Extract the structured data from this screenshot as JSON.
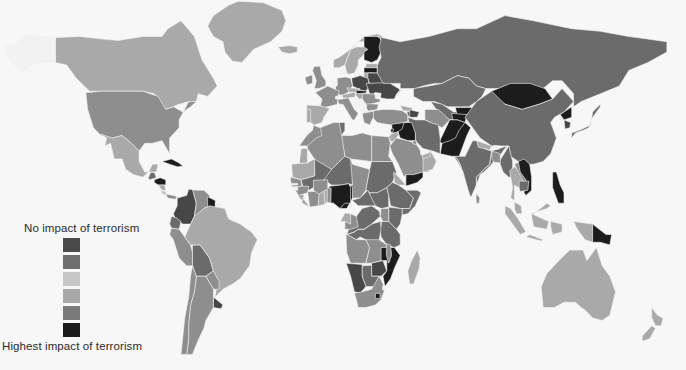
{
  "figure": {
    "type": "choropleth-world-map",
    "background_color": "#f7f7f7",
    "border_color": "#f4f4f4",
    "no_data_color": "#f2f2f2"
  },
  "legend": {
    "top_label": "No impact of terrorism",
    "bottom_label": "Highest impact of terrorism",
    "orientation": "vertical",
    "swatches": [
      {
        "name": "swatch-1",
        "color": "#4a4a4a"
      },
      {
        "name": "swatch-2",
        "color": "#6e6e6e"
      },
      {
        "name": "swatch-3",
        "color": "#c6c6c6"
      },
      {
        "name": "swatch-4",
        "color": "#a8a8a8"
      },
      {
        "name": "swatch-5",
        "color": "#7a7a7a"
      },
      {
        "name": "swatch-6",
        "color": "#1a1a1a"
      }
    ]
  },
  "footer": {
    "note": ""
  },
  "scale": {
    "none": "#d5d5d5",
    "very_low": "#c2c2c2",
    "low": "#a9a9a9",
    "medium": "#8e8e8e",
    "high": "#6b6b6b",
    "very_high": "#474747",
    "highest": "#1c1c1c",
    "nodata": "#f2f2f2"
  },
  "chart_data": {
    "type": "heatmap",
    "title": "",
    "subtitle": "",
    "xlabel": "",
    "ylabel": "",
    "legend_position": "bottom-left",
    "grid": false,
    "value_scale_low_label": "No impact of terrorism",
    "value_scale_high_label": "Highest impact of terrorism",
    "categories": [
      "No impact of terrorism",
      "Very low impact",
      "Low impact",
      "Medium impact",
      "High impact",
      "Very high impact",
      "Highest impact of terrorism"
    ],
    "regions": [
      {
        "name": "Canada",
        "level": "low"
      },
      {
        "name": "United States",
        "level": "medium"
      },
      {
        "name": "Mexico",
        "level": "low"
      },
      {
        "name": "Greenland",
        "level": "low"
      },
      {
        "name": "Cuba",
        "level": "highest"
      },
      {
        "name": "Guatemala",
        "level": "high"
      },
      {
        "name": "Honduras",
        "level": "highest"
      },
      {
        "name": "Nicaragua",
        "level": "low"
      },
      {
        "name": "Costa Rica",
        "level": "very_low"
      },
      {
        "name": "Panama",
        "level": "medium"
      },
      {
        "name": "Colombia",
        "level": "very_high"
      },
      {
        "name": "Venezuela",
        "level": "medium"
      },
      {
        "name": "Guyana",
        "level": "highest"
      },
      {
        "name": "Brazil",
        "level": "low"
      },
      {
        "name": "Peru",
        "level": "medium"
      },
      {
        "name": "Bolivia",
        "level": "high"
      },
      {
        "name": "Chile",
        "level": "medium"
      },
      {
        "name": "Argentina",
        "level": "medium"
      },
      {
        "name": "Uruguay",
        "level": "very_high"
      },
      {
        "name": "Paraguay",
        "level": "medium"
      },
      {
        "name": "Ecuador",
        "level": "high"
      },
      {
        "name": "United Kingdom",
        "level": "medium"
      },
      {
        "name": "Ireland",
        "level": "medium"
      },
      {
        "name": "Iceland",
        "level": "low"
      },
      {
        "name": "Norway",
        "level": "low"
      },
      {
        "name": "Sweden",
        "level": "low"
      },
      {
        "name": "Finland",
        "level": "highest"
      },
      {
        "name": "Estonia",
        "level": "low"
      },
      {
        "name": "Latvia",
        "level": "highest"
      },
      {
        "name": "Lithuania",
        "level": "low"
      },
      {
        "name": "Belarus",
        "level": "very_high"
      },
      {
        "name": "Poland",
        "level": "very_high"
      },
      {
        "name": "Germany",
        "level": "medium"
      },
      {
        "name": "France",
        "level": "medium"
      },
      {
        "name": "Spain",
        "level": "low"
      },
      {
        "name": "Portugal",
        "level": "low"
      },
      {
        "name": "Italy",
        "level": "medium"
      },
      {
        "name": "Austria",
        "level": "low"
      },
      {
        "name": "Czechia",
        "level": "low"
      },
      {
        "name": "Slovakia",
        "level": "highest"
      },
      {
        "name": "Hungary",
        "level": "low"
      },
      {
        "name": "Romania",
        "level": "medium"
      },
      {
        "name": "Bulgaria",
        "level": "medium"
      },
      {
        "name": "Greece",
        "level": "medium"
      },
      {
        "name": "Ukraine",
        "level": "very_high"
      },
      {
        "name": "Russia",
        "level": "high"
      },
      {
        "name": "Turkey",
        "level": "medium"
      },
      {
        "name": "Georgia",
        "level": "low"
      },
      {
        "name": "Armenia",
        "level": "high"
      },
      {
        "name": "Azerbaijan",
        "level": "very_high"
      },
      {
        "name": "Kazakhstan",
        "level": "high"
      },
      {
        "name": "Uzbekistan",
        "level": "high"
      },
      {
        "name": "Turkmenistan",
        "level": "medium"
      },
      {
        "name": "Kyrgyzstan",
        "level": "highest"
      },
      {
        "name": "Tajikistan",
        "level": "highest"
      },
      {
        "name": "Mongolia",
        "level": "highest"
      },
      {
        "name": "China",
        "level": "high"
      },
      {
        "name": "Japan",
        "level": "high"
      },
      {
        "name": "North Korea",
        "level": "highest"
      },
      {
        "name": "South Korea",
        "level": "very_high"
      },
      {
        "name": "Afghanistan",
        "level": "highest"
      },
      {
        "name": "Pakistan",
        "level": "highest"
      },
      {
        "name": "India",
        "level": "high"
      },
      {
        "name": "Nepal",
        "level": "low"
      },
      {
        "name": "Bangladesh",
        "level": "medium"
      },
      {
        "name": "Myanmar",
        "level": "high"
      },
      {
        "name": "Thailand",
        "level": "low"
      },
      {
        "name": "Vietnam",
        "level": "highest"
      },
      {
        "name": "Laos",
        "level": "medium"
      },
      {
        "name": "Cambodia",
        "level": "high"
      },
      {
        "name": "Malaysia",
        "level": "low"
      },
      {
        "name": "Indonesia",
        "level": "low"
      },
      {
        "name": "Philippines",
        "level": "highest"
      },
      {
        "name": "Papua New Guinea",
        "level": "highest"
      },
      {
        "name": "Australia",
        "level": "low"
      },
      {
        "name": "New Zealand",
        "level": "low"
      },
      {
        "name": "Sri Lanka",
        "level": "medium"
      },
      {
        "name": "Iran",
        "level": "high"
      },
      {
        "name": "Iraq",
        "level": "highest"
      },
      {
        "name": "Syria",
        "level": "highest"
      },
      {
        "name": "Lebanon",
        "level": "highest"
      },
      {
        "name": "Israel",
        "level": "highest"
      },
      {
        "name": "Jordan",
        "level": "low"
      },
      {
        "name": "Saudi Arabia",
        "level": "medium"
      },
      {
        "name": "Yemen",
        "level": "highest"
      },
      {
        "name": "Oman",
        "level": "low"
      },
      {
        "name": "United Arab Emirates",
        "level": "low"
      },
      {
        "name": "Kuwait",
        "level": "medium"
      },
      {
        "name": "Egypt",
        "level": "medium"
      },
      {
        "name": "Libya",
        "level": "medium"
      },
      {
        "name": "Tunisia",
        "level": "high"
      },
      {
        "name": "Algeria",
        "level": "medium"
      },
      {
        "name": "Morocco",
        "level": "medium"
      },
      {
        "name": "Western Sahara",
        "level": "low"
      },
      {
        "name": "Mauritania",
        "level": "low"
      },
      {
        "name": "Mali",
        "level": "high"
      },
      {
        "name": "Niger",
        "level": "high"
      },
      {
        "name": "Chad",
        "level": "medium"
      },
      {
        "name": "Sudan",
        "level": "high"
      },
      {
        "name": "South Sudan",
        "level": "high"
      },
      {
        "name": "Ethiopia",
        "level": "high"
      },
      {
        "name": "Somalia",
        "level": "high"
      },
      {
        "name": "Eritrea",
        "level": "low"
      },
      {
        "name": "Kenya",
        "level": "high"
      },
      {
        "name": "Uganda",
        "level": "medium"
      },
      {
        "name": "Tanzania",
        "level": "high"
      },
      {
        "name": "Rwanda",
        "level": "low"
      },
      {
        "name": "Burundi",
        "level": "medium"
      },
      {
        "name": "Democratic Republic of the Congo",
        "level": "high"
      },
      {
        "name": "Republic of the Congo",
        "level": "medium"
      },
      {
        "name": "Gabon",
        "level": "low"
      },
      {
        "name": "Cameroon",
        "level": "highest"
      },
      {
        "name": "Central African Republic",
        "level": "high"
      },
      {
        "name": "Nigeria",
        "level": "highest"
      },
      {
        "name": "Benin",
        "level": "medium"
      },
      {
        "name": "Togo",
        "level": "low"
      },
      {
        "name": "Ghana",
        "level": "low"
      },
      {
        "name": "Ivory Coast",
        "level": "medium"
      },
      {
        "name": "Liberia",
        "level": "low"
      },
      {
        "name": "Sierra Leone",
        "level": "low"
      },
      {
        "name": "Guinea",
        "level": "medium"
      },
      {
        "name": "Senegal",
        "level": "medium"
      },
      {
        "name": "Burkina Faso",
        "level": "medium"
      },
      {
        "name": "Angola",
        "level": "medium"
      },
      {
        "name": "Zambia",
        "level": "medium"
      },
      {
        "name": "Zimbabwe",
        "level": "very_high"
      },
      {
        "name": "Mozambique",
        "level": "highest"
      },
      {
        "name": "Malawi",
        "level": "medium"
      },
      {
        "name": "Botswana",
        "level": "high"
      },
      {
        "name": "Namibia",
        "level": "very_high"
      },
      {
        "name": "South Africa",
        "level": "medium"
      },
      {
        "name": "Lesotho",
        "level": "highest"
      },
      {
        "name": "Madagascar",
        "level": "low"
      }
    ]
  }
}
